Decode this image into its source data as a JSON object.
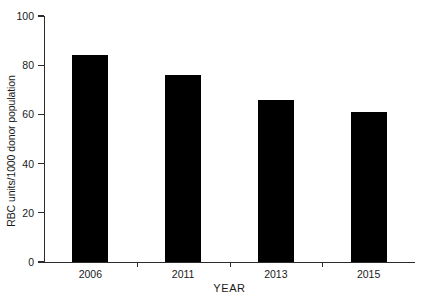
{
  "chart_data": {
    "type": "bar",
    "title": "",
    "subtitle": "",
    "categories": [
      "2006",
      "2011",
      "2013",
      "2015"
    ],
    "values": [
      84,
      76,
      66,
      61
    ],
    "series": [
      {
        "name": "RBC units/1000 donor population",
        "values": [
          84,
          76,
          66,
          61
        ]
      }
    ],
    "xlabel": "YEAR",
    "ylabel": "RBC units/1000 donor population",
    "ylim": [
      0,
      100
    ],
    "yticks": [
      0,
      20,
      40,
      60,
      80,
      100
    ],
    "ytick_labels": [
      "0",
      "20",
      "40",
      "60",
      "80",
      "100"
    ],
    "xtick_labels": [
      "2006",
      "2011",
      "2013",
      "2015"
    ],
    "grid": false,
    "legend": false,
    "legend_position": "none",
    "bar_color": "#000000",
    "axis_color": "#2b2b2b",
    "background_color": "#ffffff"
  },
  "axes": {
    "y_title": "RBC units/1000 donor population",
    "x_title": "YEAR"
  }
}
